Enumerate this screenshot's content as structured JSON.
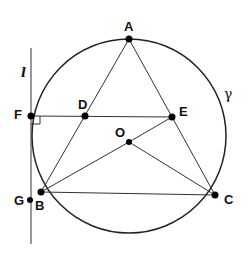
{
  "diagram": {
    "type": "geometry",
    "circle": {
      "name": "γ",
      "center": [
        129,
        136
      ],
      "radius": 97
    },
    "line_l": {
      "name": "l",
      "x": 31,
      "y1": 48,
      "y2": 244
    },
    "points": {
      "A": [
        129,
        39
      ],
      "B": [
        41,
        192
      ],
      "C": [
        215,
        195
      ],
      "D": [
        85,
        116
      ],
      "E": [
        172,
        117
      ],
      "F": [
        31,
        116
      ],
      "G": [
        30,
        200
      ],
      "O": [
        129,
        142
      ]
    },
    "segments": [
      [
        "A",
        "B"
      ],
      [
        "A",
        "C"
      ],
      [
        "B",
        "C"
      ],
      [
        "F",
        "E"
      ],
      [
        "O",
        "B"
      ],
      [
        "O",
        "C"
      ],
      [
        "O",
        "E"
      ]
    ],
    "right_angle_at": "F"
  },
  "labels": {
    "A": "A",
    "B": "B",
    "C": "C",
    "D": "D",
    "E": "E",
    "F": "F",
    "G": "G",
    "O": "O",
    "gamma": "γ",
    "l": "l"
  }
}
